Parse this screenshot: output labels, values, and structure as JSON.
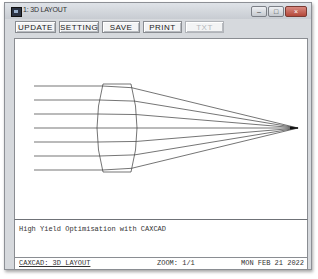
{
  "window": {
    "title": "1: 3D LAYOUT",
    "controls": {
      "minimize": "–",
      "maximize": "□",
      "close": "×"
    }
  },
  "toolbar": {
    "buttons": [
      {
        "label": "UPDATE",
        "enabled": true
      },
      {
        "label": "SETTING",
        "enabled": true
      },
      {
        "label": "SAVE",
        "enabled": true
      },
      {
        "label": "PRINT",
        "enabled": true
      },
      {
        "label": "TXT",
        "enabled": false
      }
    ]
  },
  "drawing": {
    "type": "lens-ray-trace",
    "ray_count": 7,
    "ray_start_x": 19,
    "ray_y": [
      47,
      61,
      75,
      89,
      103,
      117,
      131
    ],
    "lens": {
      "front_x": 86,
      "back_x": 118,
      "top_y": 45,
      "bottom_y": 133
    },
    "focus": {
      "x": 283,
      "y": 89
    },
    "line_color": "#3a3a3a"
  },
  "message": {
    "text": "High Yield Optimisation with CAXCAD"
  },
  "statusbar": {
    "app_view": "CAXCAD: 3D LAYOUT",
    "zoom": "ZOOM: 1/1",
    "date": "MON FEB 21 2022"
  }
}
